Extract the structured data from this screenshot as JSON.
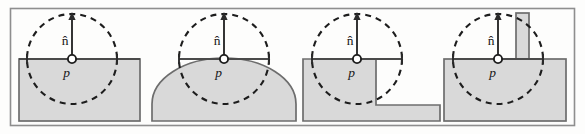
{
  "figure": {
    "name": "surface-sampling-configurations",
    "panel_count": 4,
    "colors": {
      "surface_fill": "#d9d9d9",
      "surface_stroke": "#6d6d6d",
      "circle_stroke": "#1d1d1d",
      "frame_stroke": "#8e8e8e",
      "label_color": "#171717",
      "background": "#fdfdfc"
    },
    "labels": {
      "normal": "n̂",
      "point": "p⃗"
    },
    "panels": [
      {
        "id": "panel-flat-plane",
        "geometry": "flat-plane",
        "normal_label": "n̂",
        "point_label": "p⃗",
        "sample_radius": 45
      },
      {
        "id": "panel-convex-dome",
        "geometry": "convex-dome",
        "normal_label": "n̂",
        "point_label": "p⃗",
        "sample_radius": 45
      },
      {
        "id": "panel-concave-step",
        "geometry": "concave-step",
        "normal_label": "n̂",
        "point_label": "p⃗",
        "sample_radius": 45
      },
      {
        "id": "panel-thin-fin",
        "geometry": "thin-fin",
        "normal_label": "n̂",
        "point_label": "p⃗",
        "sample_radius": 45
      }
    ]
  }
}
